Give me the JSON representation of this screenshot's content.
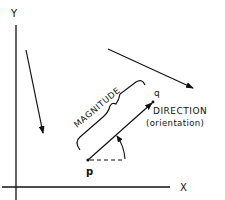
{
  "diagram": {
    "axes": {
      "x_label": "X",
      "y_label": "Y"
    },
    "vector": {
      "start_label": "p",
      "end_label": "q",
      "magnitude_label": "MAGNITUDE",
      "direction_label": "DIRECTION",
      "direction_sublabel": "(orientation)"
    },
    "other_vectors": [
      {
        "name": "vector-left-down"
      },
      {
        "name": "vector-top-right"
      }
    ],
    "colors": {
      "ink": "#111111",
      "background": "#ffffff"
    }
  }
}
